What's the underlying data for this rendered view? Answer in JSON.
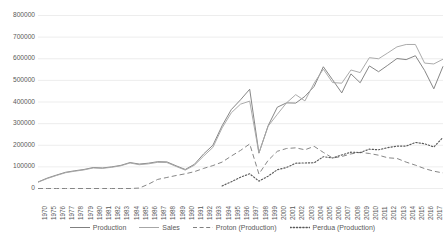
{
  "chart_data": {
    "type": "line",
    "title": "",
    "xlabel": "",
    "ylabel": "",
    "ylim": [
      0,
      800000
    ],
    "ytick_step": 100000,
    "grid": true,
    "legend_position": "bottom",
    "yticks": [
      "0",
      "100000",
      "200000",
      "300000",
      "400000",
      "500000",
      "600000",
      "700000",
      "800000"
    ],
    "categories": [
      "1970",
      "1975",
      "1976",
      "1977",
      "1978",
      "1979",
      "1980",
      "1981",
      "1982",
      "1983",
      "1984",
      "1985",
      "1986",
      "1987",
      "1988",
      "1989",
      "1990",
      "1991",
      "1992",
      "1993",
      "1994",
      "1995",
      "1996",
      "1997",
      "1998",
      "1999",
      "2000",
      "2001",
      "2002",
      "2003",
      "2004",
      "2005",
      "2006",
      "2007",
      "2008",
      "2009",
      "2010",
      "2011",
      "2012",
      "2013",
      "2014",
      "2015",
      "2016",
      "2017",
      "2018"
    ],
    "series": [
      {
        "name": "Production",
        "style": "solid",
        "color": "#808080",
        "values": [
          30000,
          48000,
          62000,
          75000,
          82000,
          88000,
          97000,
          95000,
          100000,
          107000,
          120000,
          113000,
          117000,
          124000,
          123000,
          105000,
          88000,
          112000,
          160000,
          200000,
          290000,
          365000,
          410000,
          459000,
          164000,
          290000,
          376000,
          396000,
          395000,
          426000,
          472000,
          563000,
          503000,
          442000,
          530000,
          489000,
          567000,
          540000,
          570000,
          601000,
          596000,
          614000,
          546000,
          461000,
          565000
        ]
      },
      {
        "name": "Sales",
        "style": "solid",
        "color": "#a6a6a6",
        "values": [
          29000,
          46000,
          60000,
          73000,
          80000,
          86000,
          95000,
          93000,
          98000,
          105000,
          118000,
          110000,
          114000,
          121000,
          120000,
          102000,
          85000,
          108000,
          150000,
          190000,
          280000,
          350000,
          390000,
          404000,
          163000,
          288000,
          343000,
          396000,
          434000,
          405000,
          487000,
          552000,
          490000,
          487000,
          548000,
          536000,
          605000,
          600000,
          627000,
          655000,
          666000,
          666000,
          580000,
          576000,
          598000
        ]
      },
      {
        "name": "Proton (Production)",
        "style": "dashed",
        "color": "#808080",
        "values": [
          0,
          0,
          0,
          0,
          0,
          0,
          0,
          0,
          0,
          0,
          0,
          2000,
          20000,
          42000,
          51000,
          60000,
          68000,
          78000,
          93000,
          106000,
          122000,
          150000,
          176000,
          206000,
          67000,
          130000,
          172000,
          185000,
          188000,
          179000,
          195000,
          167000,
          141000,
          148000,
          160000,
          167000,
          162000,
          154000,
          142000,
          139000,
          122000,
          108000,
          92000,
          80000,
          72000
        ]
      },
      {
        "name": "Perdua (Production)",
        "style": "dotted",
        "color": "#595959",
        "values": [
          null,
          null,
          null,
          null,
          null,
          null,
          null,
          null,
          null,
          null,
          null,
          null,
          null,
          null,
          null,
          null,
          null,
          null,
          null,
          null,
          12000,
          31000,
          52000,
          68000,
          34000,
          57000,
          87000,
          97000,
          117000,
          118000,
          119000,
          147000,
          141000,
          155000,
          168000,
          166000,
          182000,
          179000,
          189000,
          196000,
          196000,
          213000,
          207000,
          192000,
          236000
        ]
      }
    ]
  },
  "legend": {
    "items": [
      {
        "label": "Production",
        "icon": "solid-line-swatch"
      },
      {
        "label": "Sales",
        "icon": "solid-line-swatch"
      },
      {
        "label": "Proton (Production)",
        "icon": "dashed-line-swatch"
      },
      {
        "label": "Perdua (Production)",
        "icon": "dotted-line-swatch"
      }
    ]
  },
  "colors": {
    "production": "#808080",
    "sales": "#a6a6a6",
    "proton": "#808080",
    "perdua": "#595959",
    "grid": "#e8e8e8",
    "tick_text": "#595959"
  }
}
